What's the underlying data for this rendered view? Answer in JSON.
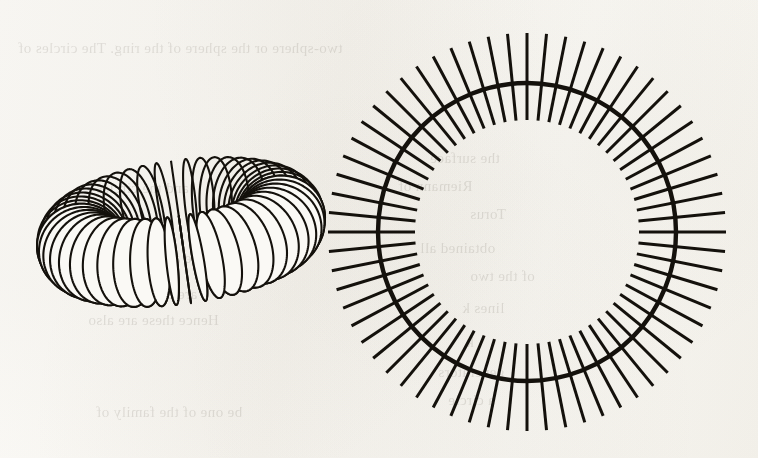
{
  "page": {
    "kind": "scanned-book-illustration",
    "background_color": "#faf9f5",
    "ink_color": "#14110c",
    "width": 758,
    "height": 458,
    "caption": "",
    "figure_label": ""
  },
  "figures": [
    {
      "id": "ribbed-torus",
      "name": "Ribbed torus (anchor ring) in oblique view",
      "type": "torus-latitude-loops",
      "center_x": 181,
      "center_y": 232,
      "ring_radius": 101,
      "tube_radius": 44,
      "tilt_degrees": 74,
      "rotation_degrees": -8,
      "loop_count": 48,
      "stroke_width": 2.1,
      "stroke_color": "#14110c",
      "bounds": {
        "left": 57,
        "top": 32,
        "right": 305,
        "bottom": 432
      },
      "hole": {
        "center_x": 168,
        "top": 125,
        "bottom": 330,
        "half_width": 20
      }
    },
    {
      "id": "spoked-circle",
      "name": "Circle with radial spokes (torus seen edge-on)",
      "type": "circle-with-radial-spokes",
      "center_x": 527,
      "center_y": 232,
      "circle_radius": 149,
      "circle_stroke_width": 4.4,
      "spoke_inner_radius": 112,
      "spoke_outer_radius": 199,
      "spoke_count": 64,
      "spoke_stroke_width": 3.0,
      "stroke_color": "#14110c",
      "bounds": {
        "left": 332,
        "top": 33,
        "right": 722,
        "bottom": 432
      }
    }
  ],
  "showthrough_text": {
    "note": "faint mirrored text bleeding through from the reverse side of the page",
    "lines": [
      {
        "text": "two-sphere or the sphere of the ring. The circles of",
        "x": 18,
        "y": 40,
        "size": 15
      },
      {
        "text": "the surface",
        "x": 430,
        "y": 150,
        "size": 15
      },
      {
        "text": "Riemann of",
        "x": 398,
        "y": 178,
        "size": 15
      },
      {
        "text": "and the circles",
        "x": 96,
        "y": 180,
        "size": 15
      },
      {
        "text": "Torus",
        "x": 470,
        "y": 206,
        "size": 15
      },
      {
        "text": "the ring",
        "x": 120,
        "y": 212,
        "size": 15
      },
      {
        "text": "obtained all",
        "x": 420,
        "y": 240,
        "size": 15
      },
      {
        "text": "latitude are shown here",
        "x": 84,
        "y": 250,
        "size": 15
      },
      {
        "text": "of the two",
        "x": 470,
        "y": 268,
        "size": 15
      },
      {
        "text": "are tangent to",
        "x": 110,
        "y": 286,
        "size": 15
      },
      {
        "text": "lines k",
        "x": 462,
        "y": 300,
        "size": 15
      },
      {
        "text": "Hence these are also",
        "x": 88,
        "y": 312,
        "size": 15
      },
      {
        "text": "k",
        "x": 466,
        "y": 334,
        "size": 15
      },
      {
        "text": "generators",
        "x": 438,
        "y": 364,
        "size": 15
      },
      {
        "text": "be one of the family of",
        "x": 96,
        "y": 404,
        "size": 15
      },
      {
        "text": "a circle",
        "x": 448,
        "y": 392,
        "size": 15
      }
    ]
  }
}
